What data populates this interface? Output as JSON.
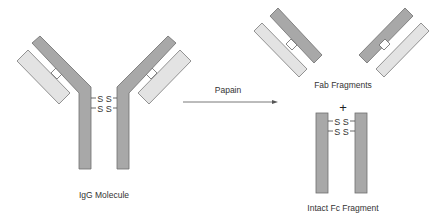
{
  "diagram": {
    "colors": {
      "heavy_chain": "#a8a8a8",
      "light_chain": "#e3e3e3",
      "outline": "#6e6e6e",
      "text": "#333333",
      "background": "#ffffff"
    },
    "igg": {
      "label": "IgG Molecule",
      "disulfide_bonds": [
        "S S",
        "S S"
      ]
    },
    "arrow": {
      "label": "Papain"
    },
    "fab": {
      "label": "Fab Fragments",
      "count": 2
    },
    "plus": "+",
    "fc": {
      "label": "Intact Fc Fragment",
      "disulfide_bonds": [
        "S S",
        "S S"
      ]
    }
  }
}
